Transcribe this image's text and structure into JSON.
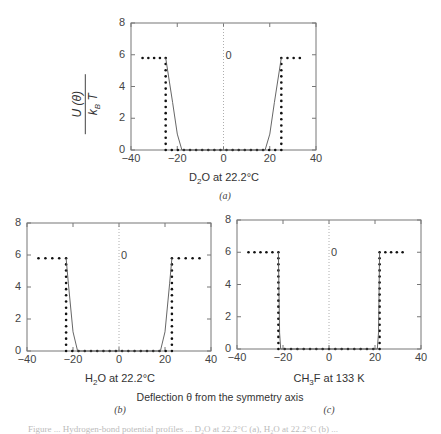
{
  "figure": {
    "common_xlabel": "Deflection θ from the symmetry axis",
    "ylabel_numerator": "U (θ)",
    "ylabel_denominator": "k_B T",
    "caption_partial": "Figure ... Hydrogen-bond potential profiles ... D₂O at 22.2°C (a), H₂O at 22.2°C (b) ..."
  },
  "chart_data": [
    {
      "type": "line",
      "panel": "(a)",
      "title": "D2O at 22.2°C",
      "xlabel": "D₂O at 22.2°C",
      "ylabel": "U(θ)/k_B T",
      "xlim": [
        -40,
        40
      ],
      "ylim": [
        0,
        8
      ],
      "xticks": [
        -40,
        -20,
        0,
        20,
        40
      ],
      "yticks": [
        0,
        2,
        4,
        6,
        8
      ],
      "annotation": "0",
      "series": [
        {
          "name": "square-well (dotted)",
          "style": "dotted",
          "x": [
            -35,
            -25,
            -25,
            25,
            25,
            33
          ],
          "y": [
            5.8,
            5.8,
            0,
            0,
            5.8,
            5.8
          ]
        },
        {
          "name": "smooth potential (solid)",
          "style": "solid",
          "x": [
            -25,
            -22,
            -20,
            -18,
            18,
            20,
            22,
            25
          ],
          "y": [
            5.8,
            3.0,
            1.0,
            0,
            0,
            1.0,
            3.0,
            5.8
          ]
        }
      ]
    },
    {
      "type": "line",
      "panel": "(b)",
      "title": "H2O at 22.2°C",
      "xlabel": "H₂O at 22.2°C",
      "xlim": [
        -40,
        40
      ],
      "ylim": [
        0,
        8
      ],
      "xticks": [
        -40,
        -20,
        0,
        20,
        40
      ],
      "yticks": [
        0,
        2,
        4,
        6,
        8
      ],
      "annotation": "0",
      "series": [
        {
          "name": "square-well (dotted)",
          "style": "dotted",
          "x": [
            -35,
            -23,
            -23,
            23,
            23,
            35
          ],
          "y": [
            5.8,
            5.8,
            0,
            0,
            5.8,
            5.8
          ]
        },
        {
          "name": "smooth potential (solid)",
          "style": "solid",
          "x": [
            -23,
            -22,
            -20,
            -18,
            18,
            20,
            22,
            23
          ],
          "y": [
            5.8,
            4.2,
            1.2,
            0,
            0,
            1.2,
            4.2,
            5.8
          ]
        }
      ]
    },
    {
      "type": "line",
      "panel": "(c)",
      "title": "CH3F at 133 K",
      "xlabel": "CH₃F at 133 K",
      "xlim": [
        -40,
        40
      ],
      "ylim": [
        0,
        8
      ],
      "xticks": [
        -40,
        -20,
        0,
        20,
        40
      ],
      "yticks": [
        0,
        2,
        4,
        6,
        8
      ],
      "annotation": "0",
      "series": [
        {
          "name": "square-well (dotted)",
          "style": "dotted",
          "x": [
            -35,
            -22,
            -22,
            22,
            22,
            32
          ],
          "y": [
            6.0,
            6.0,
            0,
            0,
            6.0,
            6.0
          ]
        },
        {
          "name": "smooth potential (solid)",
          "style": "solid",
          "x": [
            -22,
            -21.5,
            -21,
            21,
            21.5,
            22
          ],
          "y": [
            6.0,
            1.0,
            0,
            0,
            1.0,
            6.0
          ]
        }
      ]
    }
  ],
  "panels": {
    "a": {
      "xlabel_main": "D",
      "xlabel_sub": "2",
      "xlabel_rest": "O at 22.2°C",
      "label": "(a)"
    },
    "b": {
      "xlabel_main": "H",
      "xlabel_sub": "2",
      "xlabel_rest": "O at 22.2°C",
      "label": "(b)"
    },
    "c": {
      "xlabel_main": "CH",
      "xlabel_sub": "3",
      "xlabel_rest": "F at 133 K",
      "label": "(c)"
    }
  }
}
